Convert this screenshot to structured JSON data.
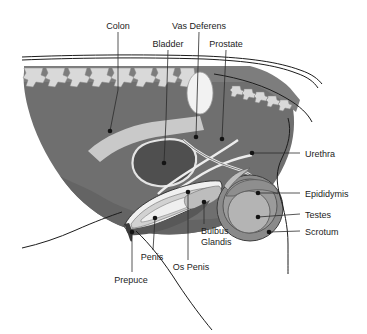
{
  "figure": {
    "kind": "anatomical-diagram",
    "palette": {
      "background": "#ffffff",
      "body_mass": "#6f6f6f",
      "body_mass_dark": "#5d5d5d",
      "spine_band": "#7d7d7d",
      "vertebrae": "#d9d9d9",
      "colon": "#c9c9c9",
      "bladder_fill": "#4f4f4f",
      "bladder_outline": "#e4e4e4",
      "prostate_oval": "#f2f2f2",
      "urethra_line": "#ededed",
      "penis_body": "#d2d2d2",
      "os_penis": "#efefef",
      "prepuce": "#585858",
      "scrotum": "#8a8a8a",
      "epididymis": "#9b9b9b",
      "testis": "#b4b4b4",
      "line": "#1c1c1c",
      "text": "#1c1c1c"
    },
    "labels": [
      {
        "id": "colon",
        "text": "Colon",
        "x": 118,
        "y": 26,
        "anchor": "middle",
        "dot": [
          110,
          131
        ]
      },
      {
        "id": "vas-deferens",
        "text": "Vas Deferens",
        "x": 199,
        "y": 26,
        "anchor": "middle",
        "dot": [
          196,
          137
        ]
      },
      {
        "id": "bladder",
        "text": "Bladder",
        "x": 168,
        "y": 44,
        "anchor": "middle",
        "dot": [
          164,
          163
        ]
      },
      {
        "id": "prostate",
        "text": "Prostate",
        "x": 226,
        "y": 44,
        "anchor": "middle",
        "dot": [
          222,
          139
        ]
      },
      {
        "id": "urethra",
        "text": "Urethra",
        "x": 305,
        "y": 156,
        "anchor": "start",
        "dot": [
          252,
          153
        ]
      },
      {
        "id": "epididymis",
        "text": "Epididymis",
        "x": 305,
        "y": 196,
        "anchor": "start",
        "dot": [
          258,
          193
        ]
      },
      {
        "id": "testes",
        "text": "Testes",
        "x": 305,
        "y": 217,
        "anchor": "start",
        "dot": [
          258,
          217
        ]
      },
      {
        "id": "scrotum",
        "text": "Scrotum",
        "x": 305,
        "y": 234,
        "anchor": "start",
        "dot": [
          269,
          232
        ]
      },
      {
        "id": "bulbus-glandis",
        "text": "Bulbus",
        "x": 201,
        "y": 231,
        "anchor": "start",
        "dot": [
          204,
          202
        ]
      },
      {
        "id": "bulbus-glandis-2",
        "text": "Glandis",
        "x": 201,
        "y": 242,
        "anchor": "start",
        "dot": null
      },
      {
        "id": "os-penis",
        "text": "Os Penis",
        "x": 191,
        "y": 267,
        "anchor": "middle",
        "dot": [
          188,
          192
        ]
      },
      {
        "id": "penis",
        "text": "Penis",
        "x": 152,
        "y": 257,
        "anchor": "middle",
        "dot": [
          155,
          218
        ]
      },
      {
        "id": "prepuce",
        "text": "Prepuce",
        "x": 131,
        "y": 280,
        "anchor": "middle",
        "dot": [
          132,
          232
        ]
      }
    ]
  }
}
